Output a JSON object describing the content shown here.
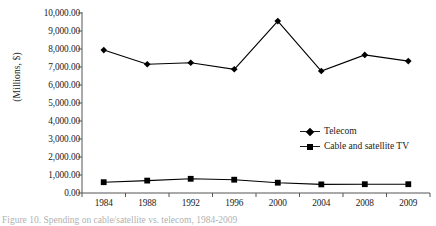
{
  "chart_data": {
    "type": "line",
    "title": "",
    "xlabel": "",
    "ylabel": "(Millions, $)",
    "categories": [
      "1984",
      "1988",
      "1992",
      "1996",
      "2000",
      "2004",
      "2008",
      "2009"
    ],
    "ylim": [
      0,
      10000
    ],
    "ytick_labels": [
      "10,000.00",
      "9,000.00",
      "8,000.00",
      "7,000.00",
      "6,000.00",
      "5,000.00",
      "4,000.00",
      "3,000.00",
      "2,000.00",
      "1,000.00",
      "0.00"
    ],
    "ytick_values": [
      10000,
      9000,
      8000,
      7000,
      6000,
      5000,
      4000,
      3000,
      2000,
      1000,
      0
    ],
    "grid": false,
    "legend_position": "middle-right",
    "series": [
      {
        "name": "Telecom",
        "marker": "diamond",
        "color": "#000000",
        "values": [
          7940,
          7150,
          7240,
          6870,
          9550,
          6780,
          7670,
          7330
        ]
      },
      {
        "name": "Cable and satellite TV",
        "marker": "square",
        "color": "#000000",
        "values": [
          600,
          690,
          790,
          740,
          570,
          480,
          490,
          490
        ]
      }
    ]
  },
  "caption": {
    "text": "Figure 10. Spending on cable/satellite vs. telecom, 1984-2009"
  }
}
